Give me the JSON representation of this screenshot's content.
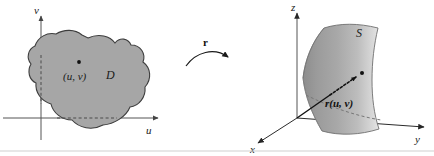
{
  "figure": {
    "caption_none": "",
    "left_panel": {
      "name": "uv-plane-domain",
      "axis_v_label": "v",
      "axis_u_label": "u",
      "region_label": "D",
      "point_label": "(u, v)"
    },
    "map_arrow": {
      "label": "r",
      "direction": "left-to-right"
    },
    "right_panel": {
      "name": "xyz-space-surface",
      "axis_x_label": "x",
      "axis_y_label": "y",
      "axis_z_label": "z",
      "surface_label": "S",
      "vector_label": "r(u, v)"
    },
    "colors": {
      "region_fill": "#a6a6a6",
      "region_stroke": "#3d3d3d",
      "surface_dark": "#8f8f8f",
      "surface_light": "#d8d8d8",
      "axis": "#555555",
      "text": "#1a1a1a",
      "background": "#ffffff"
    }
  }
}
